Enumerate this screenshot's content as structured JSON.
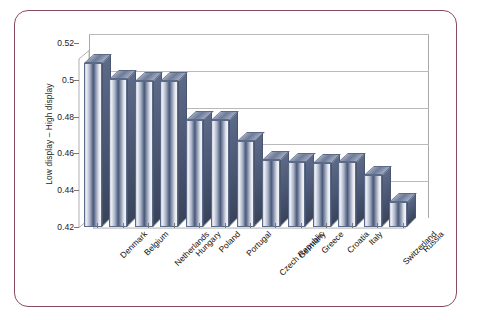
{
  "chart_data": {
    "type": "bar",
    "title": "",
    "xlabel": "",
    "ylabel": "Low display – High display",
    "ylim": [
      0.42,
      0.52
    ],
    "yticks": [
      "0.42",
      "0.44",
      "0.46",
      "0.48",
      "0.5",
      "0.52"
    ],
    "ytick_values": [
      0.42,
      0.44,
      0.46,
      0.48,
      0.5,
      0.52
    ],
    "grid": true,
    "legend": "none",
    "style": "3d-column",
    "categories": [
      "Denmark",
      "Belgium",
      "Netherlands",
      "Hungary",
      "Poland",
      "Portugal",
      "Czech Republic",
      "Germany",
      "Greece",
      "Croatia",
      "Italy",
      "Switzerland",
      "Russia"
    ],
    "values": [
      0.509,
      0.5005,
      0.4995,
      0.4993,
      0.478,
      0.478,
      0.4665,
      0.4565,
      0.4555,
      0.4548,
      0.4555,
      0.4485,
      0.4335
    ]
  },
  "colors": {
    "frame_border": "#8a4b5c",
    "bar_dark": "#4a5878",
    "bar_light": "#e9ecf2",
    "bar_side": "#47536f",
    "gridline": "#b9b9b9",
    "axis": "#a9a9a9",
    "text": "#1d1d1d",
    "background": "#ffffff"
  }
}
